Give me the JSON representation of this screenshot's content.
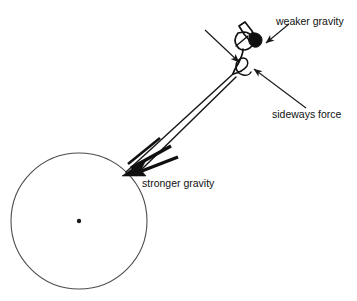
{
  "figure": {
    "background_color": "#ffffff",
    "stroke_color": "#1a1a1a",
    "planet_outline_color": "#4d4d4d",
    "width": 357,
    "height": 301
  },
  "planet": {
    "name": "planet-circle",
    "center_x": 79,
    "center_y": 221,
    "radius": 68,
    "center_dot_radius": 2.2,
    "fill": "none",
    "stroke": "#4d4d4d"
  },
  "object": {
    "name": "orbiting-object",
    "description": "small hand-sketched object with filled dark blob",
    "x": 248,
    "y": 45
  },
  "labels": [
    {
      "id": "weaker-gravity",
      "text": "weaker gravity",
      "x": 276,
      "y": 22,
      "anchor": "start"
    },
    {
      "id": "sideways-force",
      "text": "sideways force",
      "x": 272,
      "y": 115,
      "anchor": "start"
    },
    {
      "id": "stronger-gravity",
      "text": "stronger gravity",
      "x": 142,
      "y": 184,
      "anchor": "start"
    }
  ],
  "pointer_arrows": [
    {
      "id": "weaker-gravity-pointer",
      "from_x": 288,
      "from_y": 25,
      "to_x": 264,
      "to_y": 44
    },
    {
      "id": "sideways-force-pointer",
      "from_x": 306,
      "from_y": 108,
      "to_x": 253,
      "to_y": 69
    },
    {
      "id": "upper-left-pointer",
      "from_x": 205,
      "from_y": 30,
      "to_x": 239,
      "to_y": 62
    }
  ],
  "force_vectors": [
    {
      "id": "stronger-gravity-vector",
      "label": "stronger gravity",
      "from_x": 231,
      "from_y": 76,
      "to_x": 127,
      "to_y": 171,
      "style": "thick-double-shaft-arrow",
      "direction": "toward planet center"
    }
  ],
  "colors": {
    "ink": "#1a1a1a",
    "planet_line": "#4d4d4d",
    "background": "#ffffff"
  }
}
